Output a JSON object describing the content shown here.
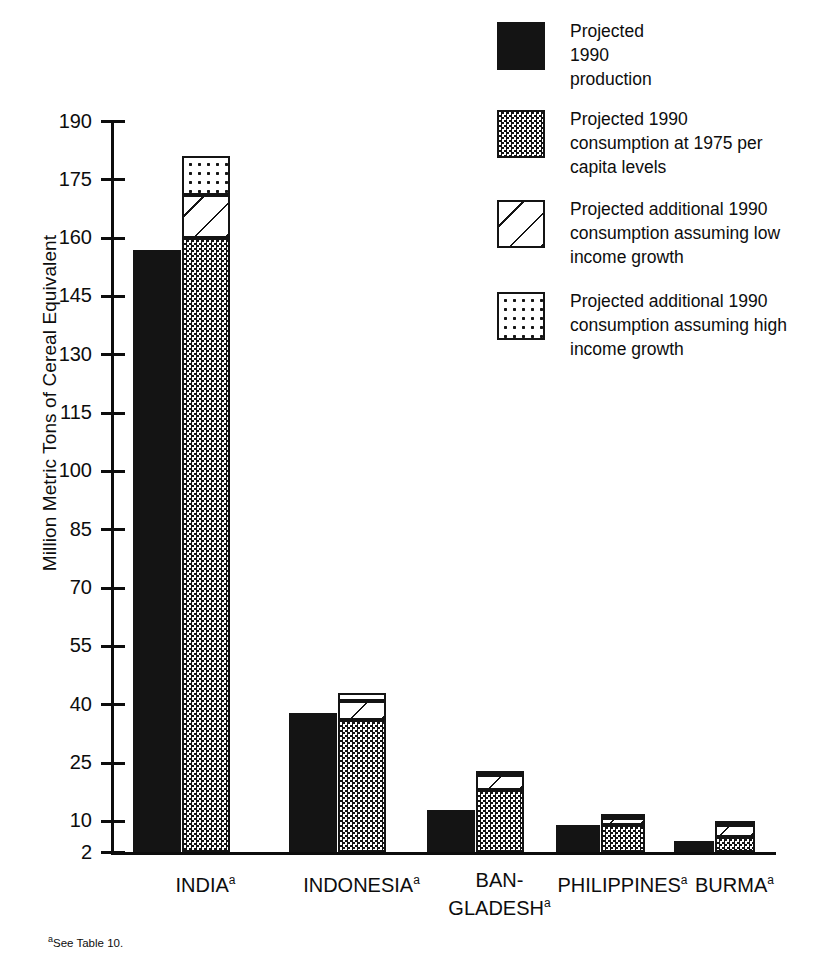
{
  "chart_data": {
    "type": "bar",
    "title": "",
    "subtitle": "",
    "xlabel": "",
    "ylabel": "Million Metric Tons of Cereal Equivalent",
    "ylim": [
      2,
      190
    ],
    "yticks": [
      2,
      10,
      25,
      40,
      55,
      70,
      85,
      100,
      115,
      130,
      145,
      160,
      175,
      190
    ],
    "ytick_labels": [
      "2",
      "10",
      "25",
      "40",
      "55",
      "70",
      "85",
      "100",
      "115",
      "130",
      "145",
      "160",
      "175",
      "190"
    ],
    "grid": false,
    "legend_position": "top-right",
    "categories": [
      "INDIA",
      "INDONESIA",
      "BAN-GLADESH",
      "PHILIPPINES",
      "BURMA"
    ],
    "category_labels": [
      {
        "line1": "INDIA",
        "line2": "",
        "footnote_marker": "a"
      },
      {
        "line1": "INDONESIA",
        "line2": "",
        "footnote_marker": "a"
      },
      {
        "line1": "BAN-",
        "line2": "GLADESH",
        "footnote_marker": "a"
      },
      {
        "line1": "PHILIPPINES",
        "line2": "",
        "footnote_marker": "a"
      },
      {
        "line1": "BURMA",
        "line2": "",
        "footnote_marker": "a"
      }
    ],
    "series": [
      {
        "name": "Projected 1990 production",
        "pattern": "solid-black",
        "group": "production",
        "values": [
          157,
          38,
          13,
          9,
          5
        ]
      },
      {
        "name": "Projected 1990 consumption at 1975 per capita levels",
        "pattern": "dense-checker",
        "group": "consumption",
        "values": [
          160,
          36,
          18,
          9,
          6
        ]
      },
      {
        "name": "Projected additional 1990 consumption assuming low income growth",
        "pattern": "diagonal-hatch",
        "group": "consumption",
        "values": [
          11,
          5,
          4,
          2,
          3
        ]
      },
      {
        "name": "Projected additional 1990 consumption assuming high income growth",
        "pattern": "sparse-dots",
        "group": "consumption",
        "values": [
          10,
          2,
          1,
          1,
          1
        ]
      }
    ],
    "consumption_totals": [
      181,
      43,
      23,
      12,
      10
    ],
    "footnote": "See Table 10.",
    "footnote_marker": "a"
  },
  "axis": {
    "y_title": "Million Metric Tons of Cereal Equivalent",
    "ticks": [
      "190",
      "175",
      "160",
      "145",
      "130",
      "115",
      "100",
      "85",
      "70",
      "55",
      "40",
      "25",
      "10",
      "2"
    ]
  },
  "legend": {
    "items": [
      {
        "swatch": "solid-black-swatch",
        "lines": [
          "Projected",
          "1990",
          "production"
        ]
      },
      {
        "swatch": "checker-swatch",
        "lines": [
          "Projected 1990",
          "consumption at 1975 per",
          "capita levels"
        ]
      },
      {
        "swatch": "hatch-swatch",
        "lines": [
          "Projected additional 1990",
          "consumption assuming low",
          "income growth"
        ]
      },
      {
        "swatch": "dots-swatch",
        "lines": [
          "Projected additional 1990",
          "consumption assuming high",
          "income growth"
        ]
      }
    ]
  },
  "footnote": {
    "marker": "a",
    "text": "See Table 10."
  },
  "colors": {
    "ink": "#141414",
    "paper": "#ffffff"
  }
}
